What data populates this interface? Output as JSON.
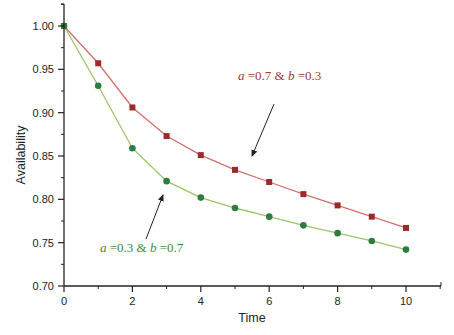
{
  "chart_data": {
    "type": "line",
    "title": "",
    "xlabel": "Time",
    "ylabel": "Availability",
    "xlim": [
      0,
      11
    ],
    "ylim": [
      0.7,
      1.025
    ],
    "x_ticks": [
      0,
      2,
      4,
      6,
      8,
      10
    ],
    "y_ticks": [
      "0.70",
      "0.75",
      "0.80",
      "0.85",
      "0.90",
      "0.95",
      "1.00"
    ],
    "grid": false,
    "legend": "none (inline annotations with arrows)",
    "x": [
      0,
      1,
      2,
      3,
      4,
      5,
      6,
      7,
      8,
      9,
      10
    ],
    "series": [
      {
        "name": "a =0.7 & b =0.3",
        "marker": "square",
        "marker_color": "#9b2b2b",
        "line_color": "#d46f6f",
        "values": [
          1.0,
          0.957,
          0.906,
          0.873,
          0.851,
          0.834,
          0.82,
          0.806,
          0.793,
          0.78,
          0.767
        ]
      },
      {
        "name": "a =0.3 & b =0.7",
        "marker": "circle",
        "marker_color": "#2e7d3e",
        "line_color": "#9cc46a",
        "values": [
          1.0,
          0.931,
          0.859,
          0.821,
          0.802,
          0.79,
          0.78,
          0.77,
          0.761,
          0.752,
          0.742
        ]
      }
    ],
    "annotations": [
      {
        "series": 0,
        "a_sym": "a",
        "a_val": " =0.7 & ",
        "b_sym": "b",
        "b_val": " =0.3",
        "color": "#a03a3a"
      },
      {
        "series": 1,
        "a_sym": "a",
        "a_val": " =0.3 & ",
        "b_sym": "b",
        "b_val": " =0.7",
        "color": "#3f8a3a"
      }
    ]
  }
}
